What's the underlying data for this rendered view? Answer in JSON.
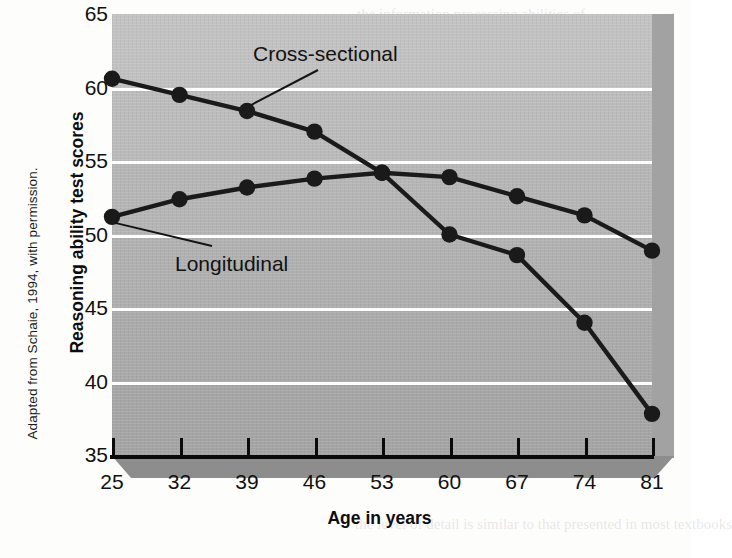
{
  "chart_data": {
    "type": "line",
    "title": "",
    "xlabel": "Age in years",
    "ylabel": "Reasoning ability test scores",
    "x": [
      25,
      32,
      39,
      46,
      53,
      60,
      67,
      74,
      81
    ],
    "xticklabels": [
      "25",
      "32",
      "39",
      "46",
      "53",
      "60",
      "67",
      "74",
      "81"
    ],
    "yticklabels": [
      "65",
      "60",
      "55",
      "50",
      "45",
      "40",
      "35"
    ],
    "yticks": [
      65,
      60,
      55,
      50,
      45,
      40,
      35
    ],
    "xlim": [
      25,
      81
    ],
    "ylim": [
      35,
      65
    ],
    "grid": true,
    "legend": "inline-annotations",
    "series": [
      {
        "name": "Cross-sectional",
        "values": [
          60.6,
          59.5,
          58.4,
          57.0,
          54.2,
          50.0,
          48.6,
          44.0,
          37.8
        ],
        "color": "#1a1a1a",
        "marker": "circle"
      },
      {
        "name": "Longitudinal",
        "values": [
          51.2,
          52.4,
          53.2,
          53.8,
          54.2,
          53.9,
          52.6,
          51.3,
          48.9
        ],
        "color": "#1a1a1a",
        "marker": "circle"
      }
    ],
    "annotations": [
      {
        "text": "Cross-sectional",
        "target_x": 39,
        "target_series": "Cross-sectional"
      },
      {
        "text": "Longitudinal",
        "target_x": 25,
        "target_series": "Longitudinal"
      }
    ],
    "colors": {
      "plot_background_top": "#c2c2c2",
      "plot_background_bottom": "#a4a4a4",
      "gridline": "#fdfdfd",
      "axis": "#0a0a0a",
      "line": "#1a1a1a",
      "page_background": "#fdfdfb",
      "side_wall": "#a2a2a2",
      "shelf": "#8d8d8d"
    }
  },
  "figure": {
    "attribution": "Adapted from Schaie, 1994, with permission.",
    "y_axis_title": "Reasoning ability test scores",
    "x_axis_title": "Age in years"
  },
  "bleed_text": {
    "line1": "the information processing abilities of",
    "line2": "the level of detail is similar to that presented in most textbooks"
  }
}
